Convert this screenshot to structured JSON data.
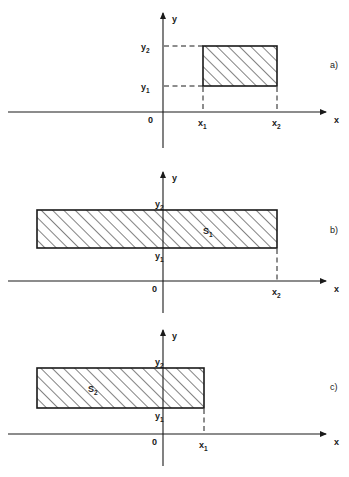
{
  "figure": {
    "background_color": "#ffffff",
    "line_color": "#1a1a1a",
    "hatch_color": "#1a1a1a",
    "axis_label_x": "x",
    "axis_label_y": "y",
    "origin_label": "0"
  },
  "panels": [
    {
      "id": "a",
      "panel_label": "a)",
      "origin_label": "0",
      "axis_label_x": "x",
      "axis_label_y": "y",
      "tick_labels": {
        "x1": "x",
        "x1_sub": "1",
        "x2": "x",
        "x2_sub": "2",
        "y1": "y",
        "y1_sub": "1",
        "y2": "y",
        "y2_sub": "2"
      },
      "region_label": "",
      "region_label_sub": "",
      "description": "Rectangle x1<=x<=x2, y1<=y<=y2 fully in first quadrant"
    },
    {
      "id": "b",
      "panel_label": "b)",
      "origin_label": "0",
      "axis_label_x": "x",
      "axis_label_y": "y",
      "tick_labels": {
        "x2": "x",
        "x2_sub": "2",
        "y1": "y",
        "y1_sub": "1",
        "y2": "y",
        "y2_sub": "2"
      },
      "region_label": "S",
      "region_label_sub": "1",
      "description": "Half-strip extending left to -infinity, bounded right by x2"
    },
    {
      "id": "c",
      "panel_label": "c)",
      "origin_label": "0",
      "axis_label_x": "x",
      "axis_label_y": "y",
      "tick_labels": {
        "x1": "x",
        "x1_sub": "1",
        "y1": "y",
        "y1_sub": "1",
        "y2": "y",
        "y2_sub": "2"
      },
      "region_label": "S",
      "region_label_sub": "2",
      "description": "Half-strip extending left to -infinity, bounded right by x1"
    }
  ]
}
